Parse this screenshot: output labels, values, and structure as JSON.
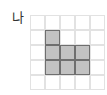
{
  "label": "나",
  "grid": {
    "rows": 5,
    "cols": 5,
    "cell_size": 15,
    "line_color": "#e2e2e2",
    "fill_color": "#c2c2c2",
    "fill_border_color": "#6f6f6f",
    "filled_cells": [
      [
        1,
        1
      ],
      [
        1,
        2
      ],
      [
        2,
        2
      ],
      [
        3,
        2
      ],
      [
        1,
        3
      ],
      [
        2,
        3
      ],
      [
        3,
        3
      ]
    ]
  }
}
